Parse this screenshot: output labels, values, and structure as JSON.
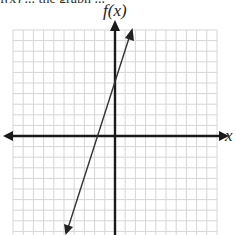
{
  "header": {
    "partial_text": "f(x) ... the graph ..."
  },
  "axes": {
    "y_label": "f(x)",
    "x_label": "x"
  },
  "colors": {
    "grid": "#d6d6d6",
    "axis": "#1a1a1a",
    "line": "#333333",
    "background": "#ffffff"
  },
  "chart_data": {
    "type": "line",
    "title": "",
    "xlabel": "x",
    "ylabel": "f(x)",
    "grid": true,
    "xlim": [
      -10,
      10
    ],
    "ylim": [
      -9,
      10
    ],
    "tick_labels": "none",
    "series": [
      {
        "name": "f(x)",
        "equation": "f(x) = 3x + 5",
        "slope": 3,
        "y_intercept": 5,
        "x_intercept": -1.67,
        "x": [
          -4.8,
          1.7
        ],
        "y": [
          -9.4,
          10.1
        ],
        "arrows_both_ends": true
      }
    ]
  }
}
